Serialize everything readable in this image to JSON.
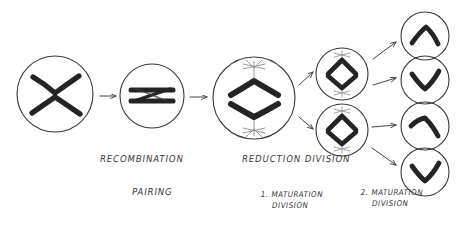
{
  "diagram": {
    "type": "biology-process-flow",
    "background_color": "#ffffff",
    "ink_color": "#333333",
    "chromosome_color": "#262626",
    "spindle_color": "#8c8c8c",
    "labels": [
      {
        "id": "recombination",
        "text": "RECOMBINATION",
        "x": 100,
        "y": 159
      },
      {
        "id": "pairing",
        "text": "PAIRING",
        "x": 132,
        "y": 192
      },
      {
        "id": "reduction-division",
        "text": "REDUCTION DIVISION",
        "x": 242,
        "y": 159
      },
      {
        "id": "first-maturation-division",
        "line1": "1. MATURATION",
        "line2": "DIVISION",
        "x": 243,
        "y": 195
      },
      {
        "id": "second-maturation-division",
        "line1": "2. MATURATION",
        "line2": "DIVISION",
        "x": 343,
        "y": 193
      }
    ],
    "cells": [
      {
        "id": "cell-1-tetrad",
        "label": "tetrad-cell",
        "cx": 55,
        "cy": 94,
        "r": 38,
        "contents": "two-crossing-chromosomes"
      },
      {
        "id": "cell-2-paired",
        "label": "paired-chromosomes-cell",
        "cx": 152,
        "cy": 96,
        "r": 32,
        "contents": "two-horizontal-paired-chromosomes"
      },
      {
        "id": "cell-3-metaphase",
        "label": "reduction-division-cell",
        "cx": 254,
        "cy": 98,
        "r": 41,
        "contents": "two-chevrons-with-spindle"
      },
      {
        "id": "cell-4-upper",
        "label": "first-division-daughter-upper",
        "cx": 342,
        "cy": 74,
        "r": 26,
        "contents": "diamond-chevrons-with-spindle"
      },
      {
        "id": "cell-5-lower",
        "label": "first-division-daughter-lower",
        "cx": 342,
        "cy": 130,
        "r": 26,
        "contents": "diamond-chevrons-with-spindle"
      },
      {
        "id": "cell-6-gamete",
        "label": "gamete-cell-1",
        "cx": 425,
        "cy": 36,
        "r": 24,
        "contents": "chevron-up"
      },
      {
        "id": "cell-7-gamete",
        "label": "gamete-cell-2",
        "cx": 425,
        "cy": 80,
        "r": 24,
        "contents": "chevron-down"
      },
      {
        "id": "cell-8-gamete",
        "label": "gamete-cell-3",
        "cx": 425,
        "cy": 126,
        "r": 24,
        "contents": "chevron-up-tilted"
      },
      {
        "id": "cell-9-gamete",
        "label": "gamete-cell-4",
        "cx": 425,
        "cy": 172,
        "r": 24,
        "contents": "chevron-down"
      }
    ],
    "arrows": [
      {
        "id": "arrow-1",
        "from": "cell-1-tetrad",
        "to": "cell-2-paired",
        "x1": 100,
        "y1": 96,
        "x2": 118,
        "y2": 96
      },
      {
        "id": "arrow-2",
        "from": "cell-2-paired",
        "to": "cell-3-metaphase",
        "x1": 190,
        "y1": 97,
        "x2": 209,
        "y2": 97
      },
      {
        "id": "arrow-3",
        "from": "cell-3-metaphase",
        "to": "cell-4-upper",
        "x1": 299,
        "y1": 84,
        "x2": 314,
        "y2": 72
      },
      {
        "id": "arrow-4",
        "from": "cell-3-metaphase",
        "to": "cell-5-lower",
        "x1": 299,
        "y1": 117,
        "x2": 314,
        "y2": 128
      },
      {
        "id": "arrow-5",
        "from": "cell-4-upper",
        "to": "cell-6-gamete",
        "x1": 372,
        "y1": 60,
        "x2": 397,
        "y2": 42
      },
      {
        "id": "arrow-6",
        "from": "cell-4-upper",
        "to": "cell-7-gamete",
        "x1": 372,
        "y1": 84,
        "x2": 397,
        "y2": 79
      },
      {
        "id": "arrow-7",
        "from": "cell-5-lower",
        "to": "cell-8-gamete",
        "x1": 372,
        "y1": 126,
        "x2": 397,
        "y2": 125
      },
      {
        "id": "arrow-8",
        "from": "cell-5-lower",
        "to": "cell-9-gamete",
        "x1": 372,
        "y1": 146,
        "x2": 397,
        "y2": 164
      }
    ]
  }
}
